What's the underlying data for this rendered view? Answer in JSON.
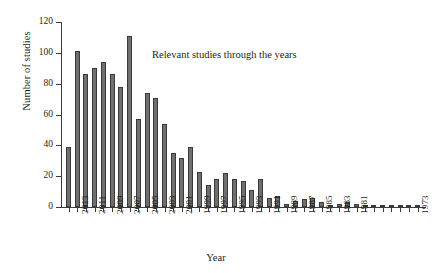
{
  "chart_data": {
    "type": "bar",
    "title": "",
    "annotation": "Relevant studies through the years",
    "xlabel": "Year",
    "ylabel": "Number of studies",
    "ylim": [
      0,
      120
    ],
    "yticks": [
      0,
      20,
      40,
      60,
      80,
      100,
      120
    ],
    "grid": false,
    "legend": null,
    "categories": [
      "2014",
      "2013",
      "2012",
      "2011",
      "2010",
      "2009",
      "2008",
      "2007",
      "2006",
      "2005",
      "2004",
      "2003",
      "2002",
      "2001",
      "2000",
      "1999",
      "1998",
      "1997",
      "1996",
      "1995",
      "1994",
      "1993",
      "1992",
      "1991",
      "1990",
      "1989",
      "1988",
      "1987",
      "1986",
      "1985",
      "1984",
      "1983",
      "1982",
      "1981",
      "1980",
      "1979",
      "1978",
      "1977",
      "1976",
      "1975",
      "1973"
    ],
    "values": [
      39,
      101,
      86,
      90,
      94,
      86,
      78,
      111,
      57,
      74,
      71,
      54,
      35,
      32,
      39,
      23,
      14,
      18,
      22,
      18,
      17,
      11,
      18,
      6,
      7,
      2,
      4,
      5,
      6,
      3,
      1,
      2,
      3,
      2,
      1,
      1,
      1,
      1,
      1,
      1,
      1
    ],
    "tick_labels": [
      "2013",
      "2011",
      "2009",
      "2007",
      "2005",
      "2003",
      "2001",
      "1999",
      "1997",
      "1995",
      "1993",
      "1991",
      "1989",
      "1987",
      "1985",
      "1983",
      "1981",
      "1973"
    ],
    "tick_label_categories": [
      "2013",
      "2011",
      "2009",
      "2007",
      "2005",
      "2003",
      "2001",
      "1999",
      "1997",
      "1995",
      "1993",
      "1991",
      "1989",
      "1987",
      "1985",
      "1983",
      "1981",
      "1973"
    ],
    "bar_color": "#6f6f6f",
    "bar_edge_color": "#3a3a3a",
    "axis_color": "#3b3b3b",
    "background": "#ffffff"
  }
}
